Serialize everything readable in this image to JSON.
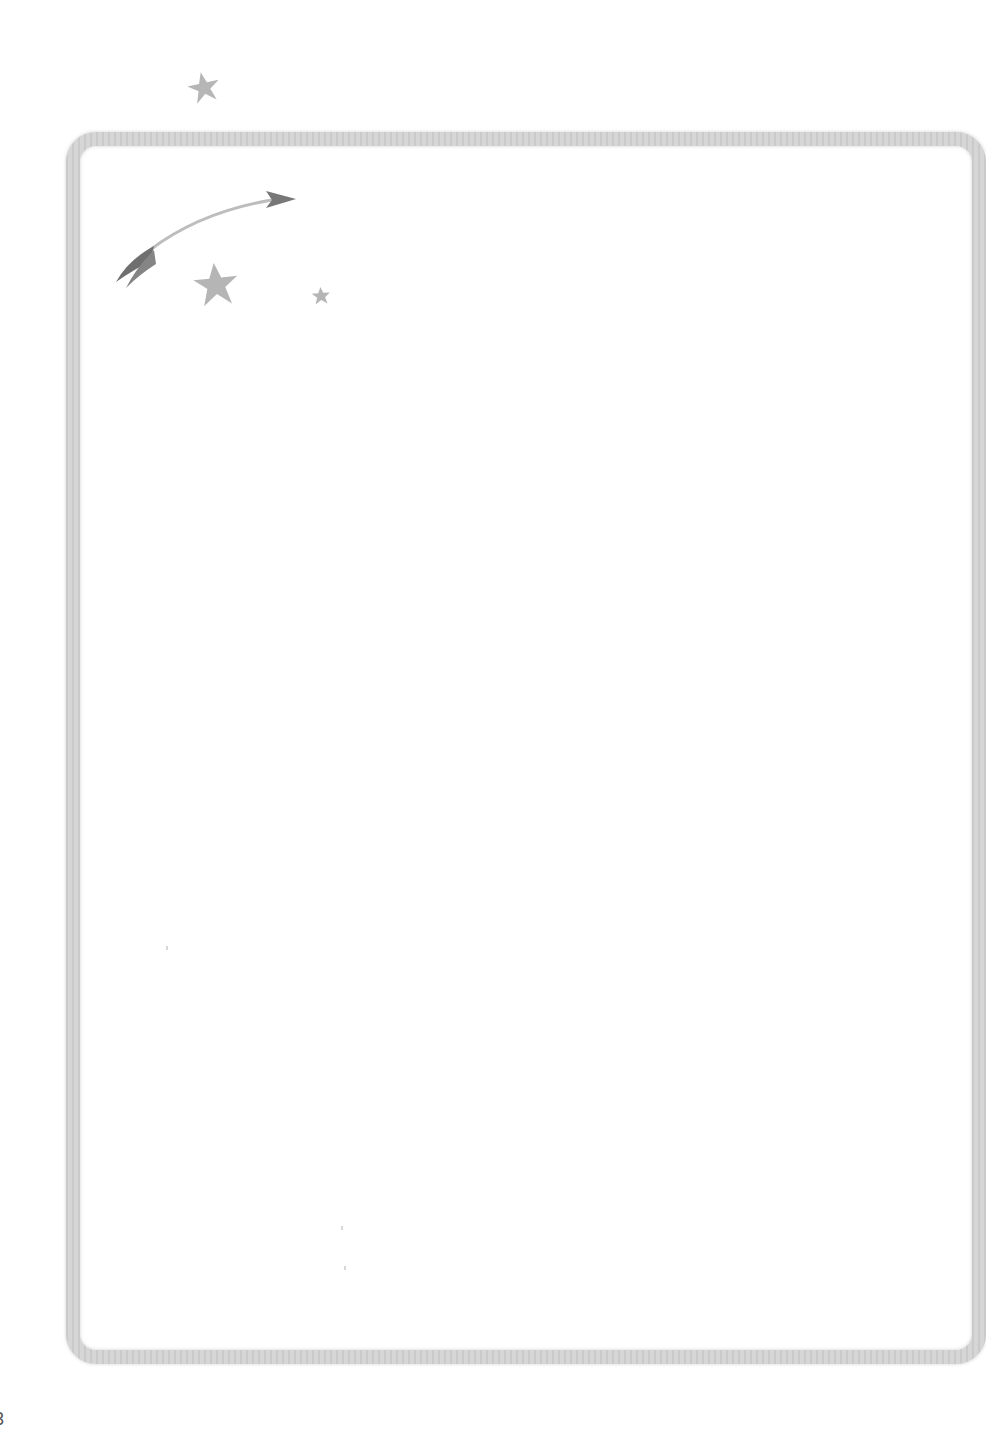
{
  "page": {
    "background": "#ffffff",
    "frame_color": "#d6d6d6"
  },
  "decorations": {
    "icons": [
      {
        "name": "star-icon",
        "size": "medium",
        "color": "#a8a8a8"
      },
      {
        "name": "arrow-icon",
        "direction": "up-right",
        "shaft_color": "#bdbdbd",
        "head_color": "#7a7a7a"
      },
      {
        "name": "star-icon",
        "size": "large",
        "color": "#a8a8a8"
      },
      {
        "name": "star-icon",
        "size": "small",
        "color": "#a8a8a8"
      }
    ]
  },
  "edge_text": "3"
}
